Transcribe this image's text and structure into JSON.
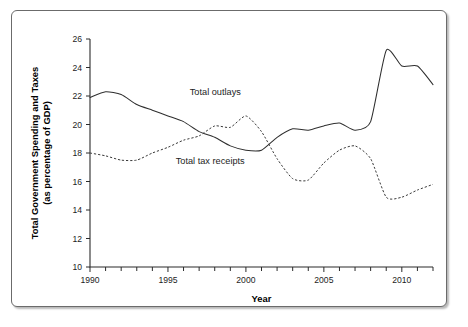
{
  "figure": {
    "frame_border_color": "#6b6b6b",
    "background_color": "#ffffff",
    "ink_color": "#2e2e2e"
  },
  "chart_data": {
    "type": "line",
    "title": "",
    "xlabel": "Year",
    "ylabel": "Total Government Spending and Taxes (as percentage of GDP)",
    "ylabel_line1": "Total Government Spending and Taxes",
    "ylabel_line2": "(as percentage of GDP)",
    "xlim": [
      1990,
      2012
    ],
    "ylim": [
      10,
      26
    ],
    "grid": false,
    "legend_position": "inline-annotations",
    "x_major_ticks": [
      1990,
      1995,
      2000,
      2005,
      2010
    ],
    "x_major_tick_labels": [
      "1990",
      "1995",
      "2000",
      "2005",
      "2010"
    ],
    "x_minor_ticks": [
      1991,
      1992,
      1993,
      1994,
      1996,
      1997,
      1998,
      1999,
      2001,
      2002,
      2003,
      2004,
      2006,
      2007,
      2008,
      2009,
      2011,
      2012
    ],
    "y_ticks": [
      10,
      12,
      14,
      16,
      18,
      20,
      22,
      24,
      26
    ],
    "y_tick_labels": [
      "10",
      "12",
      "14",
      "16",
      "18",
      "20",
      "22",
      "24",
      "26"
    ],
    "x": [
      1990,
      1991,
      1992,
      1993,
      1994,
      1995,
      1996,
      1997,
      1998,
      1999,
      2000,
      2001,
      2002,
      2003,
      2004,
      2005,
      2006,
      2007,
      2008,
      2009,
      2010,
      2011,
      2012
    ],
    "series": [
      {
        "name": "Total outlays",
        "style": "solid",
        "label_x": 1996.4,
        "label_y": 22.1,
        "values": [
          21.9,
          22.3,
          22.1,
          21.4,
          21.0,
          20.6,
          20.2,
          19.5,
          19.1,
          18.5,
          18.2,
          18.2,
          19.1,
          19.7,
          19.6,
          19.9,
          20.1,
          19.6,
          20.2,
          25.2,
          24.1,
          24.1,
          22.8
        ]
      },
      {
        "name": "Total tax receipts",
        "style": "dashed",
        "label_x": 1995.5,
        "label_y": 17.2,
        "values": [
          18.0,
          17.8,
          17.5,
          17.5,
          18.0,
          18.4,
          18.9,
          19.2,
          19.9,
          19.8,
          20.6,
          19.5,
          17.6,
          16.2,
          16.1,
          17.3,
          18.2,
          18.5,
          17.6,
          14.9,
          14.9,
          15.4,
          15.8
        ]
      }
    ]
  }
}
